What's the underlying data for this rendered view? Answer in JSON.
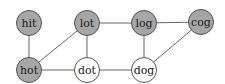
{
  "diagram": {
    "type": "undirected-graph",
    "colors": {
      "visited": "#a6a6a6",
      "unvisited": "#ffffff",
      "edge": "#555555"
    },
    "nodes": [
      {
        "id": "hit",
        "label": "hit",
        "x": 29,
        "y": 23,
        "filled": true
      },
      {
        "id": "lot",
        "label": "lot",
        "x": 87,
        "y": 23,
        "filled": true
      },
      {
        "id": "log",
        "label": "log",
        "x": 144,
        "y": 23,
        "filled": true
      },
      {
        "id": "cog",
        "label": "cog",
        "x": 201,
        "y": 22,
        "filled": true
      },
      {
        "id": "hot",
        "label": "hot",
        "x": 29,
        "y": 70,
        "filled": true
      },
      {
        "id": "dot",
        "label": "dot",
        "x": 87,
        "y": 70,
        "filled": false
      },
      {
        "id": "dog",
        "label": "dog",
        "x": 144,
        "y": 70,
        "filled": false
      }
    ],
    "edges": [
      [
        "hit",
        "hot"
      ],
      [
        "hot",
        "lot"
      ],
      [
        "hot",
        "dot"
      ],
      [
        "lot",
        "dot"
      ],
      [
        "lot",
        "log"
      ],
      [
        "log",
        "cog"
      ],
      [
        "log",
        "dog"
      ],
      [
        "dot",
        "dog"
      ],
      [
        "dog",
        "cog"
      ]
    ]
  }
}
